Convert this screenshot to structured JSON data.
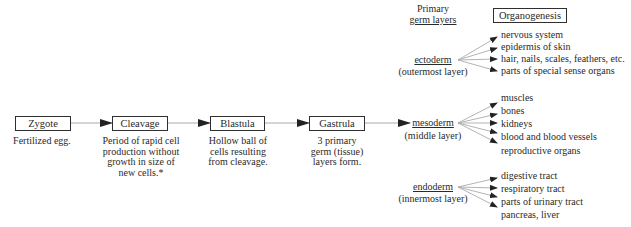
{
  "stages": [
    {
      "label": "Zygote",
      "description": "Fertilized egg."
    },
    {
      "label": "Cleavage",
      "description": "Period of rapid cell\nproduction without\ngrowth in size of\nnew cells.*"
    },
    {
      "label": "Blastula",
      "description": "Hollow ball of\ncells resulting\nfrom cleavage."
    },
    {
      "label": "Gastrula",
      "description": "3 primary\ngerm (tissue)\nlayers form."
    }
  ],
  "headers": {
    "germ_layers_line1": "Primary",
    "germ_layers_line2": "germ layers",
    "organogenesis": "Organogenesis"
  },
  "germ_layers": [
    {
      "name": "ectoderm",
      "position": "(outermost  layer)",
      "organs": [
        "nervous system",
        "epidermis of skin",
        "hair, nails, scales, feathers, etc.",
        "parts of special sense organs"
      ]
    },
    {
      "name": "mesoderm",
      "position": "(middle layer)",
      "organs": [
        "muscles",
        "bones",
        "kidneys",
        "blood and blood vessels",
        "reproductive organs"
      ]
    },
    {
      "name": "endoderm",
      "position": "(innermost layer)",
      "organs": [
        "digestive tract",
        "respiratory tract",
        "parts of urinary tract",
        "pancreas, liver"
      ]
    }
  ],
  "colors": {
    "connector": "#aaaaaa",
    "arrowhead": "#222222",
    "box_border": "#2f2f2f",
    "text": "#2a2a2a"
  }
}
